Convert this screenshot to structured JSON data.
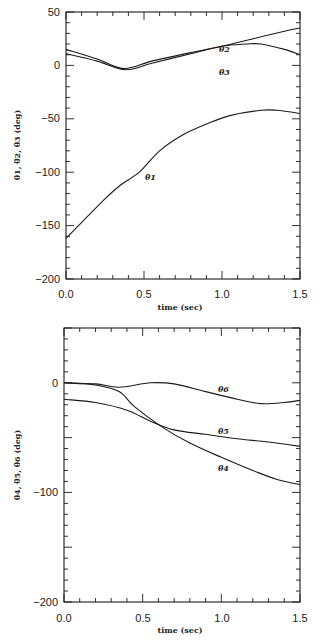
{
  "chart_data": [
    {
      "type": "line",
      "title": "",
      "xlabel": "time (sec)",
      "ylabel": "θ1, θ2, θ3 (deg)",
      "xlim": [
        0.0,
        1.5
      ],
      "ylim": [
        -200,
        50
      ],
      "xticks": [
        "0.0",
        "0.5",
        "1.0",
        "1.5"
      ],
      "yticks": [
        "50",
        "0",
        "-50",
        "-100",
        "-150",
        "-200"
      ],
      "grid": false,
      "legend": "inline labels",
      "series": [
        {
          "name": "θ1",
          "label_pos": [
            0.6,
            -100
          ],
          "x": [
            0,
            0.08,
            0.25,
            0.35,
            0.47,
            0.6,
            0.75,
            0.9,
            1.05,
            1.25,
            1.35,
            1.5
          ],
          "y": [
            -162,
            -150,
            -125,
            -112,
            -100,
            -80,
            -65,
            -55,
            -47,
            -42,
            -42,
            -45
          ]
        },
        {
          "name": "θ2",
          "label_pos": [
            0.62,
            8
          ],
          "x": [
            0,
            0.2,
            0.37,
            0.55,
            0.8,
            1.0,
            1.2,
            1.4,
            1.5
          ],
          "y": [
            15,
            6,
            -3,
            4,
            12,
            18,
            25,
            32,
            35
          ]
        },
        {
          "name": "θ3",
          "label_pos": [
            0.62,
            -9
          ],
          "x": [
            0,
            0.2,
            0.38,
            0.55,
            0.8,
            1.0,
            1.15,
            1.25,
            1.4,
            1.5
          ],
          "y": [
            11,
            4,
            -4,
            2,
            11,
            18,
            20,
            20,
            15,
            10
          ]
        }
      ]
    },
    {
      "type": "line",
      "title": "",
      "xlabel": "time (sec)",
      "ylabel": "θ4, θ5, θ6 (deg)",
      "xlim": [
        0.0,
        1.5
      ],
      "ylim": [
        -200,
        50
      ],
      "xticks": [
        "0.0",
        "0.5",
        "1.0",
        "1.5"
      ],
      "yticks": [
        "0",
        "-100",
        "-200"
      ],
      "grid": false,
      "legend": "inline labels",
      "series": [
        {
          "name": "θ4",
          "label_pos": [
            1.0,
            -78
          ],
          "x": [
            0,
            0.2,
            0.35,
            0.45,
            0.62,
            0.8,
            1.0,
            1.2,
            1.35,
            1.5
          ],
          "y": [
            0,
            -2,
            -8,
            -22,
            -40,
            -55,
            -68,
            -80,
            -88,
            -93
          ]
        },
        {
          "name": "θ5",
          "label_pos": [
            1.0,
            -44
          ],
          "x": [
            0,
            0.2,
            0.4,
            0.55,
            0.7,
            0.9,
            1.1,
            1.3,
            1.5
          ],
          "y": [
            -15,
            -18,
            -25,
            -35,
            -43,
            -47,
            -51,
            -54,
            -58
          ]
        },
        {
          "name": "θ6",
          "label_pos": [
            1.0,
            -7
          ],
          "x": [
            0,
            0.2,
            0.35,
            0.55,
            0.7,
            0.9,
            1.1,
            1.25,
            1.4,
            1.5
          ],
          "y": [
            0,
            -1,
            -4,
            0,
            -1,
            -8,
            -15,
            -19,
            -18,
            -16
          ]
        }
      ]
    }
  ],
  "labels": {
    "plot1": {
      "ylabel": "θ1, θ2, θ3 (deg)",
      "xlabel": "time (sec)",
      "xticks": [
        "0.0",
        "0.5",
        "1.0",
        "1.5"
      ],
      "yticks": [
        "50",
        "0",
        "−50",
        "−100",
        "−150",
        "−200"
      ],
      "series": [
        "θ1",
        "θ2",
        "θ3"
      ]
    },
    "plot2": {
      "ylabel": "θ4, θ5, θ6 (deg)",
      "xlabel": "time (sec)",
      "xticks": [
        "0.0",
        "0.5",
        "1.0",
        "1.5"
      ],
      "yticks": [
        "0",
        "−100",
        "−200"
      ],
      "series": [
        "θ4",
        "θ5",
        "θ6"
      ]
    }
  }
}
